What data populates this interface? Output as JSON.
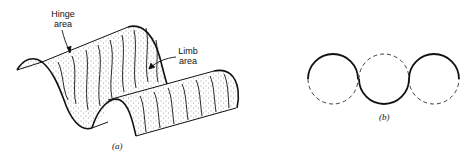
{
  "figure_a": {
    "caption": "(a)",
    "labels": {
      "hinge": [
        "Hinge",
        "area"
      ],
      "limb": [
        "Limb",
        "area"
      ]
    },
    "description": "3D fold surface with stippled hinge and limb areas"
  },
  "figure_b": {
    "caption": "(b)",
    "description": "Three tangent circles; alternating solid upper/lower semicircles trace a sinusoidal fold profile, other halves dashed",
    "circles": [
      {
        "cx": 333,
        "cy": 79,
        "r": 25,
        "solid_half": "top"
      },
      {
        "cx": 384,
        "cy": 79,
        "r": 25,
        "solid_half": "bottom"
      },
      {
        "cx": 434,
        "cy": 79,
        "r": 25,
        "solid_half": "top"
      }
    ]
  },
  "colors": {
    "ink": "#111111",
    "background": "#ffffff"
  }
}
